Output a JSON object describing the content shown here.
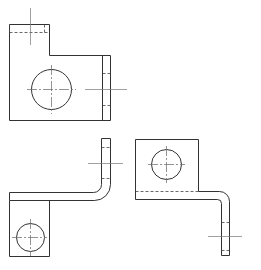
{
  "drawing": {
    "type": "orthographic-projection",
    "line_color": "#333333",
    "background": "#ffffff",
    "views": [
      {
        "name": "front-view",
        "features": [
          "outline",
          "through-hole",
          "hidden-edges",
          "center-lines"
        ]
      },
      {
        "name": "bottom-left-view",
        "features": [
          "bent-flange",
          "through-hole",
          "center-lines"
        ]
      },
      {
        "name": "bottom-right-view",
        "features": [
          "bent-flange",
          "through-hole",
          "hidden-edges",
          "center-lines"
        ]
      }
    ]
  }
}
